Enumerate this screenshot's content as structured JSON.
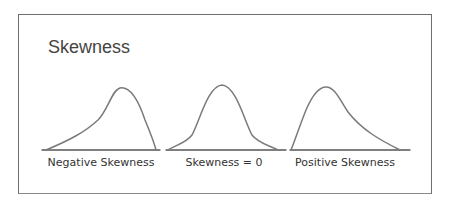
{
  "title": "Skewness",
  "panels": [
    {
      "label": "Negative Skewness",
      "shape": "left-skewed"
    },
    {
      "label": "Skewness = 0",
      "shape": "symmetric"
    },
    {
      "label": "Positive Skewness",
      "shape": "right-skewed"
    }
  ],
  "colors": {
    "curve": "#7a7a7a",
    "axis": "#555555",
    "border": "#6e6e6e",
    "text": "#333333"
  }
}
